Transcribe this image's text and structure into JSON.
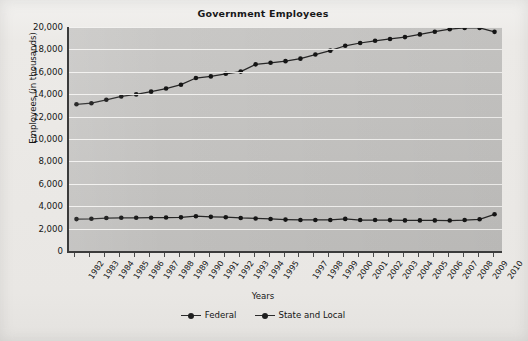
{
  "chart_data": {
    "type": "line",
    "title": "Government Employees",
    "xlabel": "Years",
    "ylabel": "Employees (in thousands)",
    "ylim": [
      0,
      20000
    ],
    "ytick_labels": [
      "20,000",
      "18,000",
      "16,000",
      "14,000",
      "12,000",
      "10,000",
      "8,000",
      "6,000",
      "4,000",
      "2,000",
      "0"
    ],
    "ytick_values": [
      20000,
      18000,
      16000,
      14000,
      12000,
      10000,
      8000,
      6000,
      4000,
      2000,
      0
    ],
    "grid": true,
    "legend_position": "bottom-center",
    "tick_labels": [
      "1982",
      "1983",
      "1984",
      "1985",
      "1986",
      "1987",
      "1988",
      "1989",
      "1990",
      "1991",
      "1992",
      "1993",
      "1994",
      "1995",
      "1997",
      "1998",
      "1999",
      "2000",
      "2001",
      "2002",
      "2003",
      "2004",
      "2005",
      "2006",
      "2007",
      "2008",
      "2009",
      "2010"
    ],
    "x": [
      1982,
      1983,
      1984,
      1985,
      1986,
      1987,
      1988,
      1989,
      1990,
      1991,
      1992,
      1993,
      1994,
      1995,
      1996,
      1997,
      1998,
      1999,
      2000,
      2001,
      2002,
      2003,
      2004,
      2005,
      2006,
      2007,
      2008,
      2009,
      2010
    ],
    "series": [
      {
        "name": "Federal",
        "color": "#272727",
        "values": [
          2848,
          2875,
          2942,
          2964,
          2966,
          2971,
          2988,
          3003,
          3105,
          3047,
          3017,
          2947,
          2908,
          2858,
          2805,
          2771,
          2771,
          2769,
          2865,
          2764,
          2766,
          2761,
          2730,
          2732,
          2732,
          2722,
          2762,
          2832,
          3278
        ]
      },
      {
        "name": "State and Local",
        "color": "#272727",
        "values": [
          13098,
          13194,
          13500,
          13800,
          13983,
          14227,
          14503,
          14849,
          15444,
          15591,
          15824,
          16016,
          16664,
          16806,
          16949,
          17172,
          17541,
          17890,
          18324,
          18571,
          18768,
          18932,
          19097,
          19341,
          19578,
          19806,
          19918,
          19921,
          19569
        ]
      }
    ]
  },
  "legend": {
    "items": [
      {
        "label": "Federal"
      },
      {
        "label": "State and Local"
      }
    ]
  }
}
